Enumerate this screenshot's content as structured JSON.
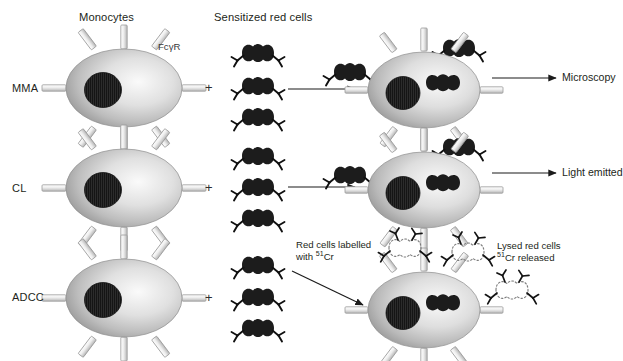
{
  "figure": {
    "background": "#ffffff",
    "ink": "#231f20"
  },
  "columns": {
    "monocytes": "Monocytes",
    "sensitized_red_cells": "Sensitized red cells"
  },
  "annotations": {
    "receptor": "FcγR",
    "plus": "+"
  },
  "rows": [
    {
      "id": "mma",
      "label": "MMA",
      "outcome": "Microscopy",
      "effector_cell": "monocyte",
      "target_cells": 3,
      "result_cell": "monocyte-with-ingested-red-cell"
    },
    {
      "id": "cl",
      "label": "CL",
      "outcome": "Light emitted",
      "effector_cell": "monocyte",
      "target_cells": 3,
      "result_cell": "monocyte-with-ingested-red-cell"
    },
    {
      "id": "adcc",
      "label": "ADCC",
      "outcome": "",
      "effector_cell": "monocyte",
      "target_cells": 3,
      "result_cell": "monocyte-with-lysed-red-cells"
    }
  ],
  "adcc_notes": {
    "input_line1": "Red cells labelled",
    "input_line2_pre": "with ",
    "input_isotope_sup": "51",
    "input_isotope": "Cr",
    "output_line1": "Lysed red cells",
    "output_isotope_sup": "51",
    "output_isotope": "Cr",
    "output_line2_post": " released"
  },
  "colors": {
    "cell_light": "#f2f2f2",
    "cell_mid": "#c9c9c9",
    "cell_dark": "#8f8f8f",
    "cell_edge": "#7c7c7c",
    "nucleus": "#2a2a2a",
    "red_cell": "#1c1c1c",
    "receptor_fill": "#e3e3e3",
    "receptor_stroke": "#9a9a9a",
    "arrow": "#1b1b1b",
    "ghost": "#8a8a8a"
  }
}
